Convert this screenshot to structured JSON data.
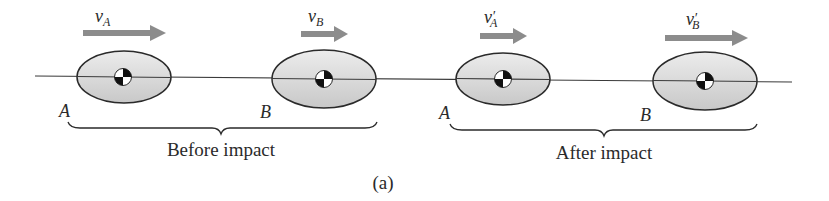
{
  "figure": {
    "caption": "(a)",
    "panels": [
      {
        "title": "Before impact",
        "bodies": [
          {
            "label": "A",
            "velocity": {
              "symbol": "v",
              "subscript": "A",
              "prime": ""
            }
          },
          {
            "label": "B",
            "velocity": {
              "symbol": "v",
              "subscript": "B",
              "prime": ""
            }
          }
        ]
      },
      {
        "title": "After impact",
        "bodies": [
          {
            "label": "A",
            "velocity": {
              "symbol": "v",
              "subscript": "A",
              "prime": "′"
            }
          },
          {
            "label": "B",
            "velocity": {
              "symbol": "v",
              "subscript": "B",
              "prime": "′"
            }
          }
        ]
      }
    ]
  },
  "colors": {
    "body_fill": "#d4d4d4",
    "body_highlight": "#ececec",
    "outline": "#2a2a2a",
    "arrow": "#8c8c8c",
    "line": "#3a3a3a",
    "text": "#2a2a2a"
  }
}
